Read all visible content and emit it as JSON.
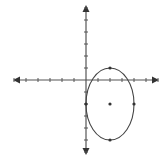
{
  "diagram": {
    "type": "coordinate-plane-ellipse",
    "grid_unit_px": 12,
    "origin_px": [
      86,
      80
    ],
    "x_axis": {
      "min_tick": -6,
      "max_tick": 6,
      "arrows": true
    },
    "y_axis": {
      "min_tick": -6,
      "max_tick": 6,
      "arrows": true
    },
    "ellipse": {
      "center": [
        2,
        -2
      ],
      "semi_axis_x": 2,
      "semi_axis_y": 3,
      "marked_points": [
        [
          2,
          -2
        ],
        [
          2,
          1
        ],
        [
          2,
          -5
        ],
        [
          4,
          -2
        ],
        [
          0,
          -2
        ]
      ]
    },
    "colors": {
      "axis": "#555555",
      "curve": "#444444",
      "points": "#333333"
    }
  }
}
